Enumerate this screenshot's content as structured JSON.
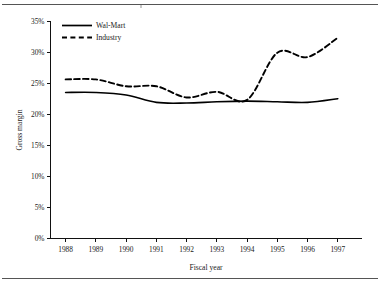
{
  "figure": {
    "name": "gross-margin-line-chart",
    "top_rule": "horizontal-rule",
    "bottom_rule": "horizontal-rule"
  },
  "chart_data": {
    "type": "line",
    "title": "",
    "xlabel": "Fiscal year",
    "ylabel": "Gross margin",
    "x": [
      1988,
      1989,
      1990,
      1991,
      1992,
      1993,
      1994,
      1995,
      1996,
      1997
    ],
    "categories": [
      "1988",
      "1989",
      "1990",
      "1991",
      "1992",
      "1993",
      "1994",
      "1995",
      "1996",
      "1997"
    ],
    "xlim": [
      1987.5,
      1997.8
    ],
    "ylim": [
      0,
      35
    ],
    "yticks": [
      0,
      5,
      10,
      15,
      20,
      25,
      30,
      35
    ],
    "ytick_labels": [
      "0%",
      "5%",
      "10%",
      "15%",
      "20%",
      "25%",
      "30%",
      "35%"
    ],
    "xtick_labels": [
      "1988",
      "1989",
      "1990",
      "1991",
      "1992",
      "1993",
      "1994",
      "1995",
      "1996",
      "1997"
    ],
    "grid": false,
    "legend_position": "top-left",
    "series": [
      {
        "name": "Wal-Mart",
        "style": "solid",
        "color": "#000000",
        "values": [
          23.5,
          23.5,
          23.1,
          21.9,
          21.8,
          22.0,
          22.1,
          22.0,
          21.9,
          22.5
        ]
      },
      {
        "name": "Industry",
        "style": "dashed",
        "color": "#000000",
        "values": [
          25.6,
          25.6,
          24.5,
          24.5,
          22.7,
          23.6,
          22.3,
          29.9,
          29.2,
          32.3
        ]
      }
    ]
  },
  "legend": {
    "entries": [
      {
        "label": "Wal-Mart",
        "style": "solid"
      },
      {
        "label": "Industry",
        "style": "dashed"
      }
    ]
  }
}
